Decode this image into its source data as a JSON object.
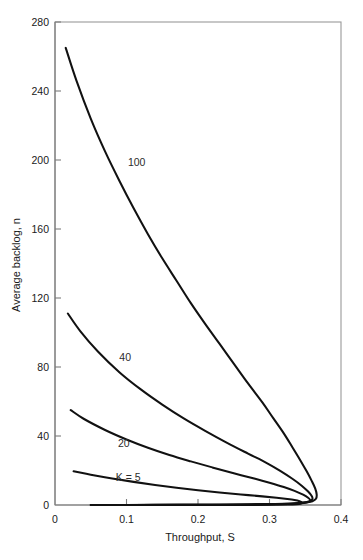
{
  "chart_data": {
    "type": "line",
    "title": "",
    "xlabel": "Throughput, S",
    "ylabel": "Average backlog, n",
    "xlim": [
      0,
      0.4
    ],
    "ylim": [
      0,
      280
    ],
    "grid": false,
    "legend_position": "inline-curve-labels",
    "xticks": [
      "0",
      "0.1",
      "0.2",
      "0.3",
      "0.4"
    ],
    "xtick_values": [
      0,
      0.1,
      0.2,
      0.3,
      0.4
    ],
    "yticks": [
      "0",
      "40",
      "80",
      "120",
      "160",
      "200",
      "240",
      "280"
    ],
    "ytick_values": [
      0,
      40,
      80,
      120,
      160,
      200,
      240,
      280
    ],
    "series": [
      {
        "name": "K = 5",
        "label": "K = 5",
        "label_x": 0.085,
        "label_y": 16,
        "points": [
          [
            0.026,
            19.5
          ],
          [
            0.05,
            17.6
          ],
          [
            0.08,
            15.4
          ],
          [
            0.11,
            13.4
          ],
          [
            0.14,
            11.6
          ],
          [
            0.17,
            10.0
          ],
          [
            0.2,
            8.6
          ],
          [
            0.23,
            7.3
          ],
          [
            0.26,
            6.1
          ],
          [
            0.29,
            5.0
          ],
          [
            0.31,
            4.2
          ],
          [
            0.325,
            3.5
          ],
          [
            0.335,
            2.9
          ],
          [
            0.342,
            2.2
          ],
          [
            0.345,
            1.5
          ],
          [
            0.344,
            0.9
          ],
          [
            0.338,
            0.5
          ],
          [
            0.325,
            0.25
          ],
          [
            0.3,
            0.1
          ],
          [
            0.26,
            0.04
          ],
          [
            0.2,
            0.02
          ],
          [
            0.13,
            0.01
          ],
          [
            0.07,
            0.0
          ]
        ]
      },
      {
        "name": "K = 20",
        "label": "20",
        "label_x": 0.088,
        "label_y": 36,
        "points": [
          [
            0.022,
            55.0
          ],
          [
            0.04,
            50.0
          ],
          [
            0.07,
            43.5
          ],
          [
            0.1,
            38.0
          ],
          [
            0.13,
            33.2
          ],
          [
            0.16,
            29.0
          ],
          [
            0.19,
            25.3
          ],
          [
            0.22,
            21.8
          ],
          [
            0.25,
            18.4
          ],
          [
            0.28,
            15.2
          ],
          [
            0.3,
            12.9
          ],
          [
            0.32,
            10.4
          ],
          [
            0.335,
            8.2
          ],
          [
            0.347,
            6.0
          ],
          [
            0.354,
            4.2
          ],
          [
            0.357,
            2.8
          ],
          [
            0.355,
            1.8
          ],
          [
            0.348,
            1.1
          ],
          [
            0.335,
            0.7
          ],
          [
            0.315,
            0.45
          ],
          [
            0.285,
            0.3
          ],
          [
            0.24,
            0.18
          ],
          [
            0.18,
            0.1
          ],
          [
            0.12,
            0.05
          ],
          [
            0.06,
            0.02
          ]
        ]
      },
      {
        "name": "K = 40",
        "label": "40",
        "label_x": 0.09,
        "label_y": 86,
        "points": [
          [
            0.018,
            111.0
          ],
          [
            0.035,
            101.0
          ],
          [
            0.06,
            89.0
          ],
          [
            0.09,
            77.0
          ],
          [
            0.12,
            67.0
          ],
          [
            0.15,
            58.2
          ],
          [
            0.18,
            50.2
          ],
          [
            0.21,
            43.0
          ],
          [
            0.24,
            36.2
          ],
          [
            0.27,
            29.8
          ],
          [
            0.295,
            24.6
          ],
          [
            0.315,
            19.8
          ],
          [
            0.332,
            15.2
          ],
          [
            0.345,
            11.2
          ],
          [
            0.354,
            7.8
          ],
          [
            0.359,
            5.2
          ],
          [
            0.36,
            3.4
          ],
          [
            0.356,
            2.2
          ],
          [
            0.347,
            1.4
          ],
          [
            0.332,
            0.9
          ],
          [
            0.308,
            0.55
          ],
          [
            0.27,
            0.35
          ],
          [
            0.22,
            0.2
          ],
          [
            0.16,
            0.1
          ],
          [
            0.1,
            0.05
          ],
          [
            0.05,
            0.02
          ]
        ]
      },
      {
        "name": "K = 100",
        "label": "100",
        "label_x": 0.102,
        "label_y": 199,
        "points": [
          [
            0.015,
            265.0
          ],
          [
            0.03,
            246.0
          ],
          [
            0.05,
            224.0
          ],
          [
            0.07,
            205.0
          ],
          [
            0.09,
            188.0
          ],
          [
            0.11,
            172.0
          ],
          [
            0.13,
            157.0
          ],
          [
            0.15,
            143.0
          ],
          [
            0.17,
            130.0
          ],
          [
            0.19,
            117.0
          ],
          [
            0.21,
            105.0
          ],
          [
            0.23,
            93.5
          ],
          [
            0.25,
            82.0
          ],
          [
            0.27,
            70.5
          ],
          [
            0.29,
            59.5
          ],
          [
            0.305,
            50.5
          ],
          [
            0.32,
            41.5
          ],
          [
            0.332,
            33.5
          ],
          [
            0.343,
            26.0
          ],
          [
            0.352,
            19.5
          ],
          [
            0.359,
            14.0
          ],
          [
            0.364,
            9.5
          ],
          [
            0.366,
            6.0
          ],
          [
            0.365,
            3.6
          ],
          [
            0.36,
            2.2
          ],
          [
            0.35,
            1.4
          ],
          [
            0.334,
            0.85
          ],
          [
            0.31,
            0.55
          ],
          [
            0.275,
            0.35
          ],
          [
            0.23,
            0.2
          ],
          [
            0.17,
            0.1
          ],
          [
            0.11,
            0.05
          ],
          [
            0.05,
            0.02
          ]
        ]
      }
    ]
  }
}
